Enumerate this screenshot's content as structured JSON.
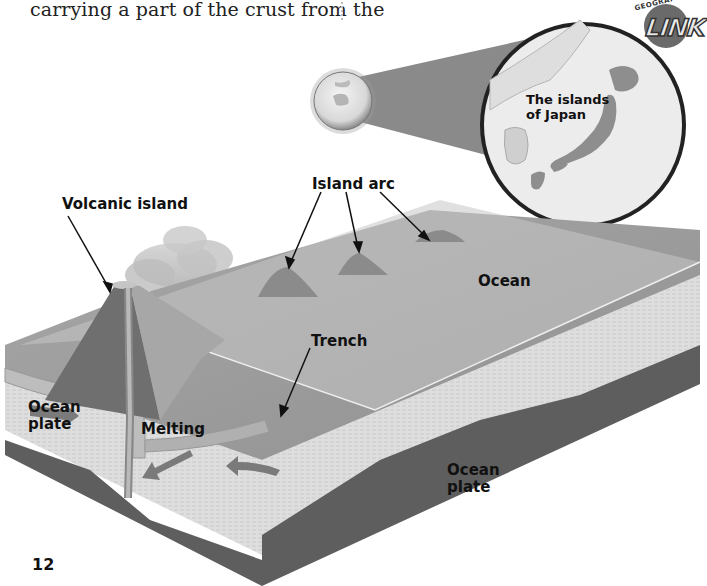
{
  "page": {
    "body_text": "carrying a part of the crust from the",
    "page_number": "12"
  },
  "badge": {
    "arc_text": "GEOGRAPHY",
    "main_text": "LINK"
  },
  "inset_map": {
    "label": "The islands of Japan",
    "label_line1": "The islands",
    "label_line2": "of Japan"
  },
  "diagram": {
    "labels": {
      "volcanic_island": "Volcanic island",
      "island_arc": "Island arc",
      "ocean": "Ocean",
      "trench": "Trench",
      "ocean_plate_left_1": "Ocean",
      "ocean_plate_left_2": "plate",
      "melting": "Melting",
      "ocean_plate_right_1": "Ocean",
      "ocean_plate_right_2": "plate"
    },
    "colors": {
      "water_surface": "#b8b8b8",
      "seafloor": "#9a9a9a",
      "crust_side": "#dcdcdc",
      "mantle_dark": "#5e5e5e",
      "volcano": "#6f6f6f",
      "map_land": "#8e8e8e",
      "map_water": "#e9e9e9"
    }
  }
}
